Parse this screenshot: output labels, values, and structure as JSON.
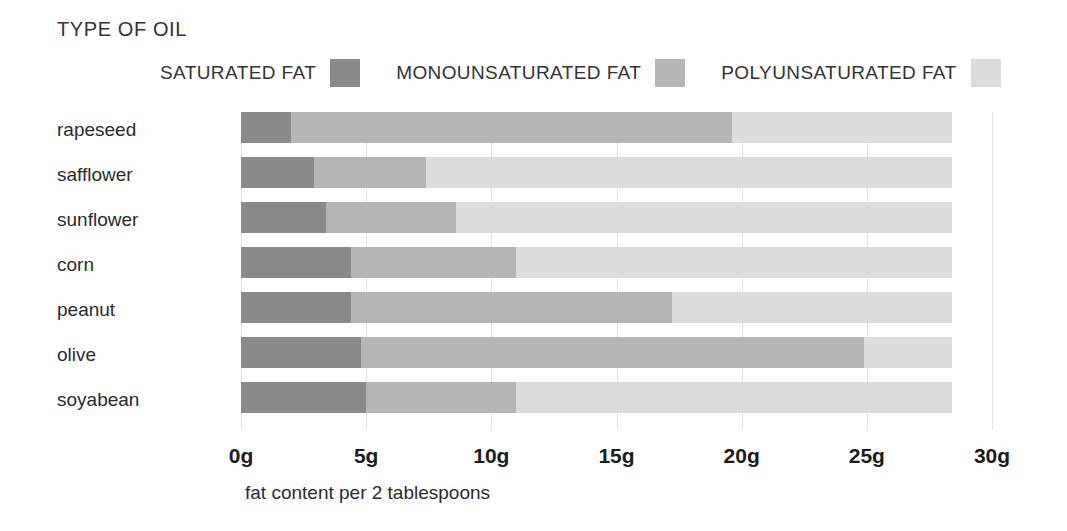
{
  "title": "TYPE OF OIL",
  "legend": {
    "items": [
      {
        "label": "SATURATED FAT",
        "color": "#8a8a8a",
        "key": "saturated"
      },
      {
        "label": "MONOUNSATURATED FAT",
        "color": "#b5b5b5",
        "key": "monounsaturated"
      },
      {
        "label": "POLYUNSATURATED FAT",
        "color": "#dcdcdc",
        "key": "polyunsaturated"
      }
    ]
  },
  "axis": {
    "x_caption": "fat content per 2 tablespoons",
    "ticks": [
      "0g",
      "5g",
      "10g",
      "15g",
      "20g",
      "25g",
      "30g"
    ],
    "tick_values": [
      0,
      5,
      10,
      15,
      20,
      25,
      30
    ]
  },
  "chart_data": {
    "type": "bar",
    "orientation": "horizontal",
    "stacked": true,
    "title": "TYPE OF OIL",
    "xlabel": "fat content per 2 tablespoons",
    "ylabel": "",
    "xlim": [
      0,
      30
    ],
    "xunit": "g",
    "xticks": [
      0,
      5,
      10,
      15,
      20,
      25,
      30
    ],
    "xticklabels": [
      "0g",
      "5g",
      "10g",
      "15g",
      "20g",
      "25g",
      "30g"
    ],
    "grid": true,
    "legend_position": "top",
    "categories": [
      "rapeseed",
      "safflower",
      "sunflower",
      "corn",
      "peanut",
      "olive",
      "soyabean"
    ],
    "series": [
      {
        "name": "SATURATED FAT",
        "color": "#8a8a8a",
        "values": [
          2.0,
          2.9,
          3.4,
          4.4,
          4.4,
          4.8,
          5.0
        ]
      },
      {
        "name": "MONOUNSATURATED FAT",
        "color": "#b5b5b5",
        "values": [
          17.6,
          4.5,
          5.2,
          6.6,
          12.8,
          20.1,
          6.0
        ]
      },
      {
        "name": "POLYUNSATURATED FAT",
        "color": "#dcdcdc",
        "values": [
          8.8,
          21.0,
          19.8,
          17.4,
          11.2,
          3.5,
          17.4
        ]
      }
    ],
    "totals": [
      28.4,
      28.4,
      28.4,
      28.4,
      28.4,
      28.4,
      28.4
    ]
  }
}
